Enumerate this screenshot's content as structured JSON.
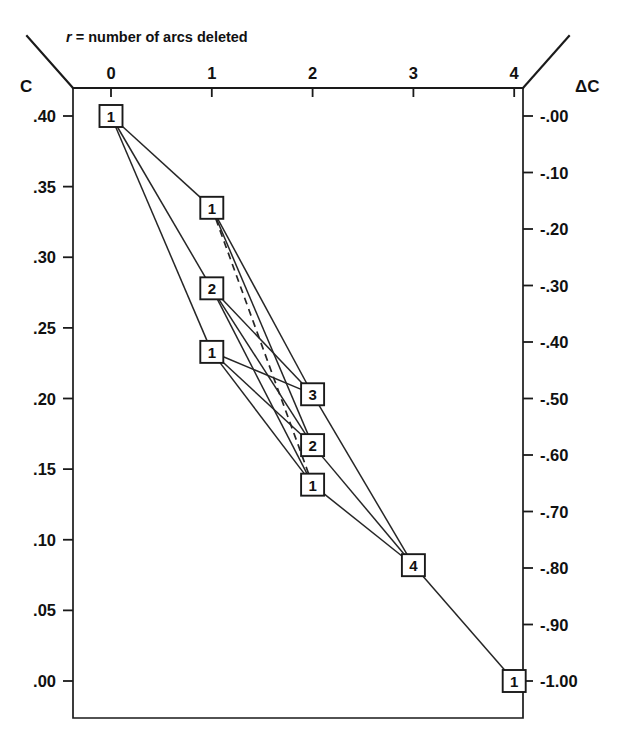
{
  "figure": {
    "caption": "r = number of arcs deleted",
    "caption_var": "r",
    "caption_rest": " = number of arcs deleted",
    "left_axis_title": "C",
    "right_axis_title": "ΔC"
  },
  "chart_data": {
    "type": "scatter",
    "title": "r = number of arcs deleted",
    "xlabel": "r = number of arcs deleted",
    "ylabel": "C",
    "y2label": "ΔC",
    "grid": false,
    "legend": null,
    "x": [
      0,
      1,
      2,
      3,
      4
    ],
    "xticklabels": [
      "0",
      "1",
      "2",
      "3",
      "4"
    ],
    "xlim": [
      -0.38,
      4.07
    ],
    "yticks": [
      0.4,
      0.35,
      0.3,
      0.25,
      0.2,
      0.15,
      0.1,
      0.05,
      0.0
    ],
    "yticklabels": [
      ".40",
      ".35",
      ".30",
      ".25",
      ".20",
      ".15",
      ".10",
      ".05",
      ".00"
    ],
    "ylim": [
      0.0,
      0.4
    ],
    "y2ticks": [
      0.0,
      -0.1,
      -0.2,
      -0.3,
      -0.4,
      -0.5,
      -0.6,
      -0.7,
      -0.8,
      -0.9,
      -1.0
    ],
    "y2ticklabels": [
      "-.00",
      "-.10",
      "-.20",
      "-.30",
      "-.40",
      "-.50",
      "-.60",
      "-.70",
      "-.80",
      "-.90",
      "-1.00"
    ],
    "y2lim": [
      -1.0,
      0.0
    ],
    "nodes": [
      {
        "id": "n0",
        "label": "1",
        "r": 0,
        "C": 0.4,
        "dC": 0.0
      },
      {
        "id": "n1a",
        "label": "1",
        "r": 1,
        "C": 0.335,
        "dC": -0.163
      },
      {
        "id": "n1b",
        "label": "2",
        "r": 1,
        "C": 0.278,
        "dC": -0.305
      },
      {
        "id": "n1c",
        "label": "1",
        "r": 1,
        "C": 0.233,
        "dC": -0.417
      },
      {
        "id": "n2a",
        "label": "3",
        "r": 2,
        "C": 0.203,
        "dC": -0.493
      },
      {
        "id": "n2b",
        "label": "2",
        "r": 2,
        "C": 0.167,
        "dC": -0.583
      },
      {
        "id": "n2c",
        "label": "1",
        "r": 2,
        "C": 0.139,
        "dC": -0.652
      },
      {
        "id": "n3a",
        "label": "4",
        "r": 3,
        "C": 0.082,
        "dC": -0.795
      },
      {
        "id": "n4a",
        "label": "1",
        "r": 4,
        "C": 0.0,
        "dC": -1.0
      }
    ],
    "edges": [
      {
        "from": "n0",
        "to": "n1a",
        "style": "solid"
      },
      {
        "from": "n0",
        "to": "n1b",
        "style": "solid"
      },
      {
        "from": "n0",
        "to": "n1c",
        "style": "solid"
      },
      {
        "from": "n1a",
        "to": "n2a",
        "style": "solid"
      },
      {
        "from": "n1a",
        "to": "n2b",
        "style": "solid"
      },
      {
        "from": "n1a",
        "to": "n2c",
        "style": "dashed"
      },
      {
        "from": "n1b",
        "to": "n2a",
        "style": "solid"
      },
      {
        "from": "n1b",
        "to": "n2b",
        "style": "solid"
      },
      {
        "from": "n1b",
        "to": "n2c",
        "style": "solid"
      },
      {
        "from": "n1c",
        "to": "n2a",
        "style": "solid"
      },
      {
        "from": "n1c",
        "to": "n2b",
        "style": "solid"
      },
      {
        "from": "n1c",
        "to": "n2c",
        "style": "solid"
      },
      {
        "from": "n2a",
        "to": "n3a",
        "style": "solid"
      },
      {
        "from": "n2b",
        "to": "n3a",
        "style": "solid"
      },
      {
        "from": "n2c",
        "to": "n3a",
        "style": "solid"
      },
      {
        "from": "n3a",
        "to": "n4a",
        "style": "solid"
      }
    ]
  }
}
